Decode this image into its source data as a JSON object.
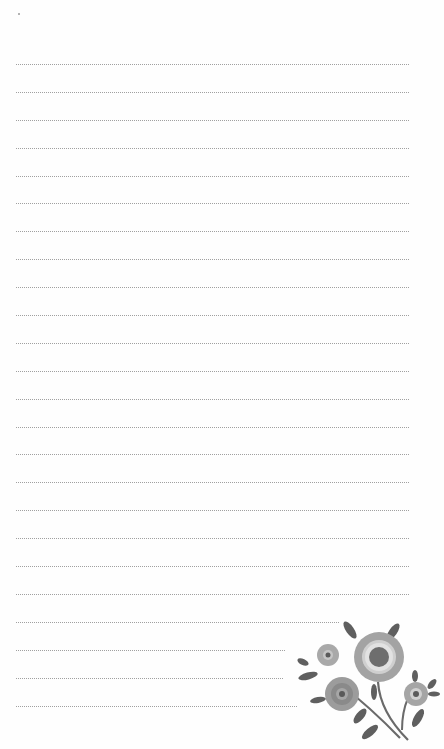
{
  "page": {
    "type": "lined notepaper",
    "background": "#ffffff",
    "line_color": "#8f8f8f",
    "line_style": "dotted",
    "line_start_x": 16,
    "line_spacing_px": 27.9,
    "first_line_y": 64,
    "lines": [
      {
        "y": 64,
        "end_x": 410
      },
      {
        "y": 92,
        "end_x": 410
      },
      {
        "y": 120,
        "end_x": 410
      },
      {
        "y": 148,
        "end_x": 410
      },
      {
        "y": 176,
        "end_x": 410
      },
      {
        "y": 203,
        "end_x": 410
      },
      {
        "y": 231,
        "end_x": 410
      },
      {
        "y": 259,
        "end_x": 410
      },
      {
        "y": 287,
        "end_x": 410
      },
      {
        "y": 315,
        "end_x": 410
      },
      {
        "y": 343,
        "end_x": 410
      },
      {
        "y": 371,
        "end_x": 410
      },
      {
        "y": 399,
        "end_x": 410
      },
      {
        "y": 427,
        "end_x": 410
      },
      {
        "y": 454,
        "end_x": 410
      },
      {
        "y": 482,
        "end_x": 410
      },
      {
        "y": 510,
        "end_x": 410
      },
      {
        "y": 538,
        "end_x": 410
      },
      {
        "y": 566,
        "end_x": 410
      },
      {
        "y": 594,
        "end_x": 410
      },
      {
        "y": 622,
        "end_x": 340
      },
      {
        "y": 650,
        "end_x": 286
      },
      {
        "y": 678,
        "end_x": 283
      },
      {
        "y": 706,
        "end_x": 298
      }
    ]
  },
  "decoration": {
    "icon": "flower-bouquet-icon",
    "colors": {
      "petal": "#9e9e9e",
      "petal_light": "#b8b8b8",
      "leaf": "#5f5f5f",
      "center": "#6a6a6a"
    }
  }
}
